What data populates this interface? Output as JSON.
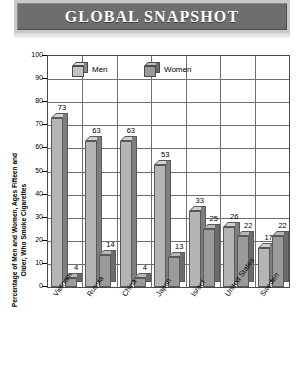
{
  "banner": {
    "title": "GLOBAL SNAPSHOT"
  },
  "legend": {
    "men_label": "Men",
    "women_label": "Women"
  },
  "chart_data": {
    "type": "bar",
    "title": "GLOBAL SNAPSHOT",
    "xlabel": "",
    "ylabel": "Percentage of Men and Women, Ages Fifteen and\nOlder, Who Smoke Cigarettes",
    "ylim": [
      0,
      100
    ],
    "yticks": [
      0,
      10,
      20,
      30,
      40,
      50,
      60,
      70,
      80,
      90,
      100
    ],
    "grid": true,
    "legend_position": "top-inside",
    "categories": [
      "Vietnam",
      "Russia",
      "China",
      "Japan",
      "Israel",
      "United States",
      "Sweden"
    ],
    "series": [
      {
        "name": "Men",
        "values": [
          73,
          63,
          63,
          53,
          33,
          26,
          17
        ]
      },
      {
        "name": "Women",
        "values": [
          4,
          14,
          4,
          13,
          25,
          22,
          22
        ]
      }
    ],
    "colors": {
      "men_front": "#b5b5b5",
      "men_side": "#7e7e7e",
      "men_top": "#d2d2d2",
      "women_front": "#9a9a9a",
      "women_side": "#6b6b6b",
      "women_top": "#b8b8b8",
      "banner_bg": "#6e6e6e",
      "banner_frame": "#c9c9c9",
      "grid": "#6f6f6f",
      "background": "#ffffff"
    }
  }
}
